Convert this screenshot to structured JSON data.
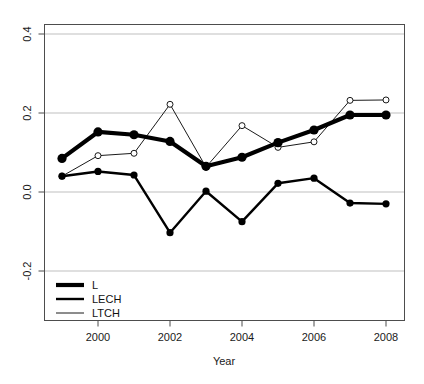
{
  "chart_data": {
    "type": "line",
    "title": "",
    "subtitle": "",
    "xlabel": "Year",
    "ylabel": "",
    "x": [
      1999,
      2000,
      2001,
      2002,
      2003,
      2004,
      2005,
      2006,
      2007,
      2008
    ],
    "xlim": [
      1998.5,
      2008.5
    ],
    "ylim": [
      -0.28,
      0.46
    ],
    "xticks": [
      2000,
      2002,
      2004,
      2006,
      2008
    ],
    "xtick_labels": [
      "2000",
      "2002",
      "2004",
      "2006",
      "2008"
    ],
    "yticks": [
      -0.2,
      0.0,
      0.2,
      0.4
    ],
    "ytick_labels": [
      "-0.2",
      "0.0",
      "0.2",
      "0.4"
    ],
    "grid": true,
    "grid_color": "#bfbfbf",
    "legend_position": "bottom-left",
    "series": [
      {
        "name": "L",
        "values": [
          0.085,
          0.152,
          0.145,
          0.128,
          0.065,
          0.088,
          0.125,
          0.157,
          0.195,
          0.195
        ],
        "line_width": 4.2,
        "color": "#000000",
        "marker": "filled-circle",
        "marker_size": 4.6
      },
      {
        "name": "LECH",
        "values": [
          0.04,
          0.052,
          0.043,
          -0.103,
          0.002,
          -0.075,
          0.022,
          0.035,
          -0.028,
          -0.03
        ],
        "line_width": 2.4,
        "color": "#000000",
        "marker": "filled-circle",
        "marker_size": 3.6
      },
      {
        "name": "LTCH",
        "values": [
          0.04,
          0.092,
          0.098,
          0.222,
          0.063,
          0.168,
          0.113,
          0.127,
          0.232,
          0.233
        ],
        "line_width": 0.9,
        "color": "#000000",
        "marker": "open-circle",
        "marker_size": 3.0
      }
    ],
    "legend": [
      {
        "label": "L",
        "line_width": 4.2
      },
      {
        "label": "LECH",
        "line_width": 2.4
      },
      {
        "label": "LTCH",
        "line_width": 0.9
      }
    ]
  },
  "axes": {
    "x_title": "Year",
    "y_tick_0": "0.4",
    "y_tick_1": "0.2",
    "y_tick_2": "0.0",
    "y_tick_3": "-0.2",
    "x_tick_0": "2000",
    "x_tick_1": "2002",
    "x_tick_2": "2004",
    "x_tick_3": "2006",
    "x_tick_4": "2008"
  },
  "legend_items": {
    "item_0": "L",
    "item_1": "LECH",
    "item_2": "LTCH"
  },
  "colors": {
    "line": "#000000",
    "grid": "#bfbfbf",
    "frame": "#4d4d4d",
    "text": "#1a1a1a",
    "background": "#ffffff"
  }
}
